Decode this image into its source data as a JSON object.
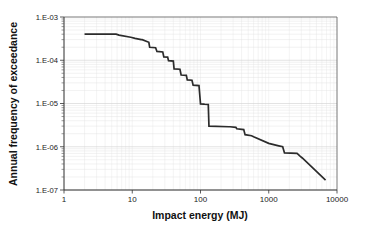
{
  "chart_data": {
    "type": "line",
    "title": "",
    "xlabel": "Impact energy (MJ)",
    "ylabel": "Annual frequency of exceedance",
    "xscale": "log",
    "yscale": "log",
    "xlim": [
      1,
      10000
    ],
    "ylim": [
      1e-07,
      0.001
    ],
    "grid": true,
    "legend": false,
    "xticks": [
      1,
      10,
      100,
      1000,
      10000
    ],
    "xtick_labels": [
      "1",
      "10",
      "100",
      "1000",
      "10000"
    ],
    "yticks": [
      0.001,
      0.0001,
      1e-05,
      1e-06,
      1e-07
    ],
    "ytick_labels": [
      "1.E-03",
      "1.E-04",
      "1.E-05",
      "1.E-06",
      "1.E-07"
    ],
    "series": [
      {
        "name": "exceedance",
        "color": "#2b2b2b",
        "x": [
          2.0,
          5.8,
          6.4,
          9.5,
          11.0,
          13.5,
          14.0,
          17.5,
          18.0,
          22.0,
          23.0,
          28.0,
          29.0,
          33.0,
          34.0,
          40.0,
          41.0,
          50.0,
          52.0,
          62.0,
          64.0,
          75.0,
          78.0,
          95.0,
          100.0,
          112.0,
          115.0,
          130.0,
          133.0,
          260.0,
          270.0,
          330.0,
          340.0,
          430.0,
          450.0,
          560.0,
          600.0,
          1000.0,
          1400.0,
          1600.0,
          1700.0,
          2600.0,
          2900.0,
          3100.0,
          6800.0
        ],
        "y": [
          0.0004,
          0.0004,
          0.00038,
          0.00034,
          0.00032,
          0.0003,
          0.0003,
          0.00026,
          0.0002,
          0.000195,
          0.00016,
          0.000155,
          0.00012,
          0.000118,
          9.8e-05,
          9.55e-05,
          6.3e-05,
          6.2e-05,
          4.55e-05,
          4.48e-05,
          3.5e-05,
          3.45e-05,
          2.65e-05,
          2.6e-05,
          9.8e-06,
          9.7e-06,
          9.6e-06,
          9.5e-06,
          3e-06,
          2.9e-06,
          2.9e-06,
          2.8e-06,
          2.6e-06,
          2.5e-06,
          1.9e-06,
          1.8e-06,
          1.7e-06,
          1.2e-06,
          1.05e-06,
          1e-06,
          7.2e-07,
          7e-07,
          6e-07,
          5.5e-07,
          1.7e-07
        ]
      }
    ]
  },
  "axes": {
    "x_title": "Impact energy (MJ)",
    "y_title": "Annual frequency of exceedance"
  }
}
